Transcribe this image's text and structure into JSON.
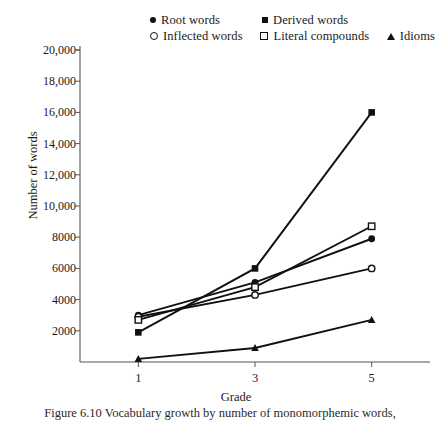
{
  "legend": {
    "items": [
      {
        "label": "Root words",
        "marker": "filled-circle"
      },
      {
        "label": "Derived words",
        "marker": "filled-square"
      },
      {
        "label": "Inflected words",
        "marker": "open-circle"
      },
      {
        "label": "Literal compounds",
        "marker": "open-square"
      },
      {
        "label": "Idioms",
        "marker": "filled-triangle"
      }
    ]
  },
  "axis": {
    "ylabel": "Number of words",
    "xlabel": "Grade",
    "yticks": [
      "20,000",
      "18,000",
      "16,000",
      "14,000",
      "12,000",
      "10,000",
      "8000",
      "6000",
      "4000",
      "2000"
    ],
    "ytick_values": [
      20000,
      18000,
      16000,
      14000,
      12000,
      10000,
      8000,
      6000,
      4000,
      2000
    ],
    "xticks": [
      "1",
      "3",
      "5"
    ]
  },
  "caption": "Figure 6.10   Vocabulary growth by number of monomorphemic words,",
  "chart_data": {
    "type": "line",
    "title": "",
    "xlabel": "Grade",
    "ylabel": "Number of words",
    "x": [
      1,
      3,
      5
    ],
    "xlim": [
      0,
      6
    ],
    "ylim": [
      0,
      20000
    ],
    "grid": false,
    "legend_position": "top",
    "series": [
      {
        "name": "Root words",
        "marker": "filled-circle",
        "values": [
          3000,
          5100,
          7900
        ]
      },
      {
        "name": "Derived words",
        "marker": "filled-square",
        "values": [
          1900,
          6000,
          16000
        ]
      },
      {
        "name": "Inflected words",
        "marker": "open-circle",
        "values": [
          2900,
          4300,
          6000
        ]
      },
      {
        "name": "Literal compounds",
        "marker": "open-square",
        "values": [
          2700,
          4800,
          8700
        ]
      },
      {
        "name": "Idioms",
        "marker": "filled-triangle",
        "values": [
          200,
          900,
          2700
        ]
      }
    ]
  },
  "colors": {
    "line": "#111111",
    "axis": "#555555",
    "text": "#1a1a1a"
  }
}
